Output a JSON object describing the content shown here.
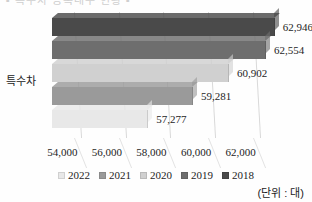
{
  "top_cropped_text": "▪ 특수차 등록대수 현황 ▪",
  "category_label": "특수차",
  "unit_note": "(단위 : 대)",
  "legend": {
    "items": [
      {
        "label": "2022",
        "color": "#e8e8e8"
      },
      {
        "label": "2021",
        "color": "#9a9a9a"
      },
      {
        "label": "2020",
        "color": "#d0d0d0"
      },
      {
        "label": "2019",
        "color": "#6e6e6e"
      },
      {
        "label": "2018",
        "color": "#4a4a4a"
      }
    ]
  },
  "chart_data": {
    "type": "bar",
    "orientation": "horizontal",
    "three_d": true,
    "title": "",
    "xlabel": "",
    "ylabel": "",
    "categories": [
      "특수차"
    ],
    "xlim": [
      53000,
      63500
    ],
    "grid": true,
    "legend_position": "bottom",
    "xticks": [
      "54,000",
      "56,000",
      "58,000",
      "60,000",
      "62,000"
    ],
    "xtick_values": [
      54000,
      56000,
      58000,
      60000,
      62000
    ],
    "series": [
      {
        "name": "2018",
        "value": 62946,
        "label": "62,946",
        "color": "#4a4a4a"
      },
      {
        "name": "2019",
        "value": 62554,
        "label": "62,554",
        "color": "#6e6e6e"
      },
      {
        "name": "2020",
        "value": 60902,
        "label": "60,902",
        "color": "#d0d0d0"
      },
      {
        "name": "2021",
        "value": 59281,
        "label": "59,281",
        "color": "#9a9a9a"
      },
      {
        "name": "2022",
        "value": 57277,
        "label": "57,277",
        "color": "#e8e8e8"
      }
    ]
  }
}
